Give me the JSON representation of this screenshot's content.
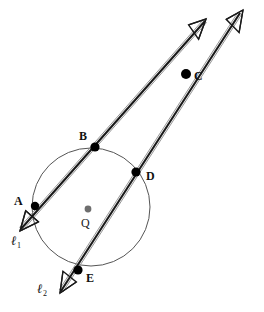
{
  "figure": {
    "width": 264,
    "height": 312,
    "background_color": "#ffffff",
    "stroke_color": "#1a1a1a",
    "circle_stroke_color": "#555555",
    "point_fill_color": "#000000",
    "center_fill_color": "#6e6e6e"
  },
  "circle": {
    "name": "circle-Q",
    "cx": 91,
    "cy": 207,
    "r": 59,
    "stroke_width": 1
  },
  "center": {
    "name": "center-point",
    "label": "Q",
    "cx": 88,
    "cy": 209,
    "r": 3.4,
    "label_x": 81,
    "label_y": 217
  },
  "points": [
    {
      "id": "A",
      "label": "A",
      "cx": 35,
      "cy": 206,
      "r": 4.2,
      "label_x": 14,
      "label_y": 195
    },
    {
      "id": "B",
      "label": "B",
      "cx": 95,
      "cy": 147,
      "r": 4.6,
      "label_x": 79,
      "label_y": 130
    },
    {
      "id": "C",
      "label": "C",
      "cx": 186,
      "cy": 74,
      "r": 5.0,
      "label_x": 194,
      "label_y": 70
    },
    {
      "id": "D",
      "label": "D",
      "cx": 136,
      "cy": 172,
      "r": 4.6,
      "label_x": 146,
      "label_y": 170
    },
    {
      "id": "E",
      "label": "E",
      "cx": 78,
      "cy": 270,
      "r": 4.6,
      "label_x": 86,
      "label_y": 272
    }
  ],
  "lines": [
    {
      "id": "l1",
      "label": "ℓ",
      "subscript": "1",
      "through_points": [
        "A",
        "B",
        "C"
      ],
      "label_x": 11,
      "label_y": 234,
      "x1": 21,
      "y1": 229,
      "x2": 205,
      "y2": 21
    },
    {
      "id": "l2",
      "label": "ℓ",
      "subscript": "2",
      "through_points": [
        "E",
        "D",
        "C"
      ],
      "label_x": 37,
      "label_y": 282,
      "x1": 61,
      "y1": 291,
      "x2": 240,
      "y2": 13
    }
  ],
  "arrowheads": [
    {
      "id": "arrow-l1-top",
      "tip_x": 206,
      "tip_y": 19,
      "angle_deg": -48,
      "size": 19
    },
    {
      "id": "arrow-l2-top",
      "tip_x": 243,
      "tip_y": 10,
      "angle_deg": -57,
      "size": 19
    },
    {
      "id": "arrow-l1-bottom",
      "tip_x": 20,
      "tip_y": 231,
      "angle_deg": 131,
      "size": 18
    },
    {
      "id": "arrow-l2-bottom",
      "tip_x": 60,
      "tip_y": 293,
      "angle_deg": 122,
      "size": 18
    }
  ]
}
